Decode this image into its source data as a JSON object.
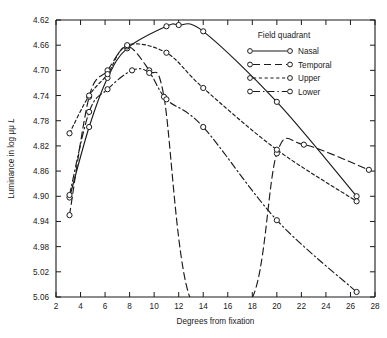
{
  "chart_data": {
    "type": "line",
    "title": "",
    "xlabel": "Degrees from fixation",
    "ylabel": "Luminance in log μμ L",
    "ylabel_parts": {
      "prefix": "Luminance in log ",
      "mu": "μμ ",
      "symbol": "L"
    },
    "xlim": [
      2,
      28
    ],
    "ylim": [
      5.06,
      4.62
    ],
    "y_inverted": true,
    "grid": false,
    "xticks": [
      2,
      4,
      6,
      8,
      10,
      12,
      14,
      16,
      18,
      20,
      22,
      24,
      26,
      28
    ],
    "xtick_labels": [
      "2",
      "4",
      "6",
      "8",
      "10",
      "12",
      "14",
      "16",
      "18",
      "20",
      "22",
      "24",
      "26",
      "28"
    ],
    "yticks": [
      4.62,
      4.66,
      4.7,
      4.74,
      4.78,
      4.82,
      4.86,
      4.9,
      4.94,
      4.98,
      5.02,
      5.06
    ],
    "ytick_labels": [
      "4.62",
      "4.66",
      "4.70",
      "4.74",
      "4.78",
      "4.82",
      "4.86",
      "4.90",
      "4.94",
      "4.98",
      "5.02",
      "5.06"
    ],
    "legend": {
      "title": "Field quadrant",
      "position": "upper-right",
      "entries": [
        {
          "label": "Nasal",
          "dash": "none"
        },
        {
          "label": "Temporal",
          "dash": "long"
        },
        {
          "label": "Upper",
          "dash": "short"
        },
        {
          "label": "Lower",
          "dash": "dashdot"
        }
      ]
    },
    "series": [
      {
        "name": "Nasal",
        "dash": "none",
        "dasharray": "",
        "points": [
          {
            "x": 3.1,
            "y": 4.902
          },
          {
            "x": 4.7,
            "y": 4.79
          },
          {
            "x": 6.2,
            "y": 4.712
          },
          {
            "x": 7.8,
            "y": 4.665
          },
          {
            "x": 11.0,
            "y": 4.63
          },
          {
            "x": 12.0,
            "y": 4.628
          },
          {
            "x": 14.0,
            "y": 4.638
          },
          {
            "x": 20.0,
            "y": 4.75
          },
          {
            "x": 26.5,
            "y": 4.9
          }
        ]
      },
      {
        "name": "Temporal",
        "dash": "long",
        "dasharray": "7 4",
        "points": [
          {
            "x": 3.1,
            "y": 4.93
          },
          {
            "x": 4.7,
            "y": 4.742
          },
          {
            "x": 6.2,
            "y": 4.7
          },
          {
            "x": 7.8,
            "y": 4.662
          },
          {
            "x": 9.6,
            "y": 4.7
          },
          {
            "x": 10.8,
            "y": 4.742
          },
          {
            "x": 13.0,
            "y": 5.065
          },
          {
            "x": 17.9,
            "y": 5.065
          },
          {
            "x": 20.0,
            "y": 4.832
          },
          {
            "x": 22.2,
            "y": 4.818
          },
          {
            "x": 27.5,
            "y": 4.858
          }
        ]
      },
      {
        "name": "Upper",
        "dash": "short",
        "dasharray": "3.2 2.6",
        "points": [
          {
            "x": 3.1,
            "y": 4.8
          },
          {
            "x": 4.7,
            "y": 4.74
          },
          {
            "x": 6.2,
            "y": 4.706
          },
          {
            "x": 7.8,
            "y": 4.66
          },
          {
            "x": 11.0,
            "y": 4.672
          },
          {
            "x": 14.0,
            "y": 4.728
          },
          {
            "x": 20.0,
            "y": 4.826
          },
          {
            "x": 26.5,
            "y": 4.908
          }
        ]
      },
      {
        "name": "Lower",
        "dash": "dashdot",
        "dasharray": "7 3 1.4 3",
        "points": [
          {
            "x": 3.1,
            "y": 4.898
          },
          {
            "x": 4.7,
            "y": 4.766
          },
          {
            "x": 6.2,
            "y": 4.73
          },
          {
            "x": 8.2,
            "y": 4.7
          },
          {
            "x": 9.6,
            "y": 4.704
          },
          {
            "x": 11.0,
            "y": 4.746
          },
          {
            "x": 14.0,
            "y": 4.79
          },
          {
            "x": 20.0,
            "y": 4.938
          },
          {
            "x": 26.5,
            "y": 5.052
          }
        ]
      }
    ]
  }
}
